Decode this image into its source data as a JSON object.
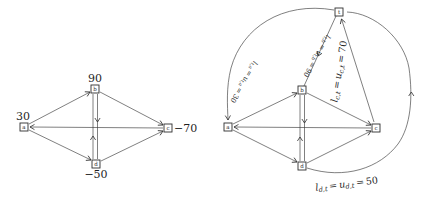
{
  "left_graph": {
    "nodes": [
      {
        "id": "a",
        "balance": "30"
      },
      {
        "id": "b",
        "balance": "90"
      },
      {
        "id": "c",
        "balance": "−70"
      },
      {
        "id": "d",
        "balance": "−50"
      }
    ],
    "edges": [
      "a→b",
      "b→c",
      "c→a",
      "a→d",
      "d→c",
      "b→d",
      "d→b"
    ]
  },
  "right_graph": {
    "nodes": [
      {
        "id": "a"
      },
      {
        "id": "b"
      },
      {
        "id": "c"
      },
      {
        "id": "d"
      },
      {
        "id": "t"
      }
    ],
    "edges": [
      "a→b",
      "b→c",
      "c→a",
      "a→d",
      "d→c",
      "b→d",
      "d→b",
      "t→a",
      "t→b",
      "c→t",
      "d→t"
    ],
    "capacity_labels": {
      "ta": {
        "lhs": "l",
        "rhs": "u",
        "sub": "t,a",
        "eq": "=",
        "value": "30"
      },
      "tb": {
        "lhs": "l",
        "rhs": "u",
        "sub": "t,b",
        "eq": "=",
        "value": "90"
      },
      "ct": {
        "lhs": "l",
        "rhs": "u",
        "sub": "c,t",
        "eq": "=",
        "value": "70"
      },
      "dt": {
        "lhs": "l",
        "rhs": "u",
        "sub": "d,t",
        "eq": "=",
        "value": "50"
      }
    }
  }
}
